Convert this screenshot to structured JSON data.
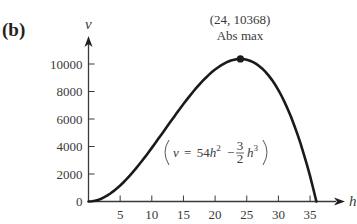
{
  "panel_label": "(b)",
  "chart_data": {
    "type": "line",
    "title": "",
    "xlabel": "h",
    "ylabel": "v",
    "xlim": [
      0,
      38
    ],
    "ylim": [
      0,
      11000
    ],
    "x_ticks": [
      5,
      10,
      15,
      20,
      25,
      30,
      35
    ],
    "y_ticks": [
      0,
      2000,
      4000,
      6000,
      8000,
      10000
    ],
    "grid": false,
    "legend": null,
    "series": [
      {
        "name": "v = 54h^2 - (3/2)h^3",
        "x": [
          0,
          2,
          4,
          6,
          8,
          10,
          12,
          14,
          16,
          18,
          20,
          22,
          24,
          26,
          28,
          30,
          32,
          34,
          36
        ],
        "values": [
          0,
          204,
          768,
          1620,
          2688,
          3900,
          5184,
          6468,
          7680,
          8748,
          9600,
          10164,
          10368,
          10140,
          9408,
          8100,
          6144,
          3468,
          0
        ]
      }
    ],
    "annotations": [
      {
        "text": "(24, 10368)",
        "x": 24,
        "y": 10368
      },
      {
        "text": "Abs max",
        "x": 24,
        "y": 10368
      }
    ],
    "equation_label": {
      "lhs": "v",
      "equals": "=",
      "coef1": "54",
      "var1": "h",
      "exp1": "2",
      "minus": "−",
      "frac_num": "3",
      "frac_den": "2",
      "var2": "h",
      "exp2": "3"
    }
  },
  "x_tick_labels": [
    "5",
    "10",
    "15",
    "20",
    "25",
    "30",
    "35"
  ],
  "y_tick_labels": [
    "0",
    "2000",
    "4000",
    "6000",
    "8000",
    "10000"
  ],
  "max_point": {
    "coord_label": "(24, 10368)",
    "label": "Abs max"
  }
}
